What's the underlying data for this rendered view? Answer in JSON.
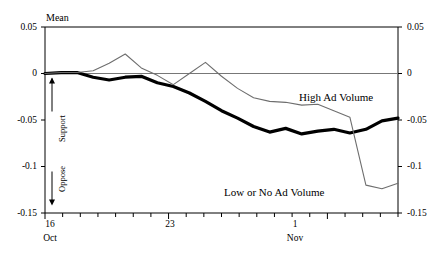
{
  "chart_data": {
    "type": "line",
    "title": "",
    "ylabel": "Mean",
    "xlabel": "",
    "ylim": [
      -0.15,
      0.05
    ],
    "grid": false,
    "zero_line": true,
    "legend_position": "inline-annotation",
    "y_ticks": [
      "0.05",
      "0",
      "-0.05",
      "-0.1",
      "-0.15"
    ],
    "y_tick_values": [
      0.05,
      0,
      -0.05,
      -0.1,
      -0.15
    ],
    "y_ticks_right": [
      "0.05",
      "0",
      "-0.05",
      "-0.1",
      "-0.15"
    ],
    "x_tick_labels": [
      {
        "text": "16",
        "sub": "Oct",
        "value": 0
      },
      {
        "text": "23",
        "sub": "",
        "value": 7
      },
      {
        "text": "1",
        "sub": "Nov",
        "value": 16
      }
    ],
    "x_minor_tick_count": 21,
    "xlim": [
      0,
      20
    ],
    "annotations": [
      {
        "text": "Support",
        "direction": "up",
        "at_value": 0
      },
      {
        "text": "Oppose",
        "direction": "down",
        "at_value": 0
      }
    ],
    "series": [
      {
        "name": "High Ad Volume",
        "style": "thick-black",
        "color": "#000000",
        "width": 3.2,
        "label_x": 17.2,
        "label_y": -0.032,
        "x": [
          0,
          1,
          2,
          3,
          4,
          5,
          6,
          7,
          8,
          9,
          10,
          11,
          12,
          13,
          14,
          15,
          16,
          17,
          18,
          19
        ],
        "values": [
          0.0,
          0.001,
          0.001,
          -0.004,
          -0.007,
          -0.004,
          -0.003,
          -0.01,
          -0.014,
          -0.021,
          -0.03,
          -0.04,
          -0.048,
          -0.057,
          -0.063,
          -0.059,
          -0.065,
          -0.062,
          -0.06,
          -0.064
        ]
      },
      {
        "name": "Low or No Ad Volume",
        "style": "thin-gray",
        "color": "#6e6e6e",
        "width": 1.1,
        "label_x": 9.6,
        "label_y": -0.131,
        "x": [
          0,
          1,
          2,
          3,
          4,
          5,
          6,
          7,
          8,
          9,
          10,
          11,
          12,
          13,
          14,
          15,
          16,
          17,
          18,
          19
        ],
        "values": [
          0.0,
          0.001,
          0.001,
          0.003,
          0.011,
          0.021,
          0.006,
          -0.002,
          -0.012,
          0.0,
          0.012,
          -0.003,
          -0.016,
          -0.026,
          -0.03,
          -0.031,
          -0.034,
          -0.033,
          -0.04,
          -0.047
        ]
      }
    ],
    "series_tail": [
      {
        "name": "High Ad Volume",
        "x": [
          19,
          20,
          21,
          22
        ],
        "values": [
          -0.064,
          -0.06,
          -0.051,
          -0.048
        ]
      },
      {
        "name": "Low or No Ad Volume",
        "x": [
          19,
          20,
          21,
          22
        ],
        "values": [
          -0.047,
          -0.12,
          -0.124,
          -0.118
        ]
      }
    ]
  },
  "labels": {
    "y_axis_title": "Mean",
    "series_high": "High Ad Volume",
    "series_low": "Low or No Ad Volume",
    "support": "Support",
    "oppose": "Oppose",
    "x_16": "16",
    "x_oct": "Oct",
    "x_23": "23",
    "x_1": "1",
    "x_nov": "Nov",
    "y_005": "0.05",
    "y_0": "0",
    "y_m005": "-0.05",
    "y_m01": "-0.1",
    "y_m015": "-0.15",
    "yr_005": "0.05",
    "yr_0": "0",
    "yr_m005": "-0.05",
    "yr_m01": "-0.1",
    "yr_m015": "-0.15"
  },
  "colors": {
    "axis": "#000000",
    "zero_line": "#777777",
    "series_high": "#000000",
    "series_low": "#6e6e6e",
    "background": "#ffffff"
  }
}
